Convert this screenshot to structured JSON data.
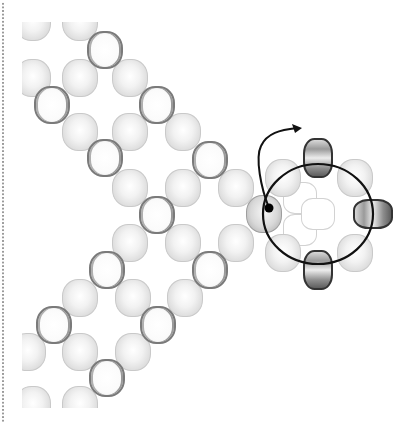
{
  "diagram": {
    "title": "",
    "colors": {
      "background": "#ffffff",
      "filled_bead": "#e4e4e4",
      "ring_bead_outline": "#7a7a7a",
      "dark_bead": "#5e5e5e",
      "thread": "#111111",
      "dotted_border": "#9a9a9a"
    },
    "beads": {
      "filled": [
        [
          33,
          22
        ],
        [
          80,
          22
        ],
        [
          33,
          78
        ],
        [
          80,
          78
        ],
        [
          130,
          78
        ],
        [
          80,
          132
        ],
        [
          130,
          132
        ],
        [
          183,
          132
        ],
        [
          130,
          188
        ],
        [
          183,
          188
        ],
        [
          236,
          188
        ],
        [
          130,
          243
        ],
        [
          183,
          243
        ],
        [
          236,
          243
        ],
        [
          80,
          298
        ],
        [
          133,
          298
        ],
        [
          185,
          298
        ],
        [
          28,
          352
        ],
        [
          80,
          352
        ],
        [
          133,
          352
        ],
        [
          33,
          405
        ],
        [
          80,
          405
        ]
      ],
      "ring": [
        [
          105,
          50
        ],
        [
          52,
          105
        ],
        [
          157,
          105
        ],
        [
          105,
          158
        ],
        [
          210,
          160
        ],
        [
          157,
          215
        ],
        [
          107,
          270
        ],
        [
          210,
          270
        ],
        [
          54,
          325
        ],
        [
          158,
          325
        ],
        [
          107,
          378
        ]
      ],
      "cluster": {
        "start_bead": [
          264,
          214
        ],
        "light": [
          [
            283,
            178
          ],
          [
            355,
            178
          ],
          [
            283,
            253
          ],
          [
            355,
            253
          ]
        ],
        "dark_vertical": [
          [
            318,
            158
          ],
          [
            318,
            270
          ]
        ],
        "dark_horizontal": [
          [
            373,
            214
          ]
        ],
        "faint_center": [
          [
            300,
            198
          ],
          [
            300,
            230
          ],
          [
            318,
            214
          ]
        ]
      }
    },
    "thread": {
      "start_dot": [
        269,
        208
      ],
      "ellipse": {
        "cx": 318,
        "cy": 214,
        "rx": 55,
        "ry": 50
      },
      "arrow_tip": [
        302,
        128
      ]
    }
  }
}
